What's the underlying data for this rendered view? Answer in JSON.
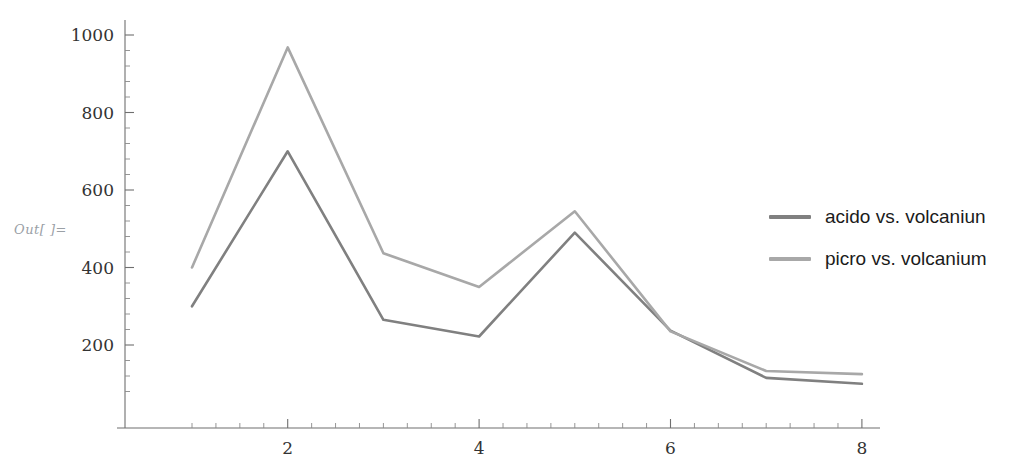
{
  "output_prompt": "Out[ ]=",
  "legend": {
    "position": "right",
    "entries": [
      {
        "label": "acido vs. volcaniun",
        "color": "#808080",
        "icon": "line-swatch"
      },
      {
        "label": "picro vs. volcanium",
        "color": "#a8a8a8",
        "icon": "line-swatch"
      }
    ]
  },
  "axes": {
    "x_ticks": [
      "2",
      "4",
      "6",
      "8"
    ],
    "y_ticks": [
      "200",
      "400",
      "600",
      "800",
      "1000"
    ]
  },
  "chart_data": {
    "type": "line",
    "title": "",
    "xlabel": "",
    "ylabel": "",
    "x": [
      1,
      2,
      3,
      4,
      5,
      6,
      7,
      8
    ],
    "xlim": [
      0.55,
      8.45
    ],
    "ylim": [
      55,
      1020
    ],
    "grid": false,
    "legend_position": "right",
    "series": [
      {
        "name": "acido vs. volcaniun",
        "color": "#808080",
        "values": [
          300,
          700,
          265,
          222,
          490,
          237,
          115,
          100
        ]
      },
      {
        "name": "picro vs. volcanium",
        "color": "#a8a8a8",
        "values": [
          400,
          968,
          437,
          350,
          545,
          235,
          133,
          125
        ]
      }
    ]
  }
}
